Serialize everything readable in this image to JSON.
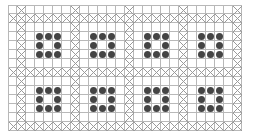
{
  "board": {
    "cols": 26,
    "rows": 14,
    "cell_size": 9,
    "separator_cols": [
      1,
      7,
      13,
      19,
      25
    ],
    "separator_rows": [
      1,
      7,
      13
    ],
    "blocks": [
      {
        "row": 0,
        "col": 0,
        "pieces": 8
      },
      {
        "row": 0,
        "col": 1,
        "pieces": 8
      },
      {
        "row": 0,
        "col": 2,
        "pieces": 8
      },
      {
        "row": 0,
        "col": 3,
        "pieces": 8
      },
      {
        "row": 1,
        "col": 0,
        "pieces": 8
      },
      {
        "row": 1,
        "col": 1,
        "pieces": 8
      },
      {
        "row": 1,
        "col": 2,
        "pieces": 8
      },
      {
        "row": 1,
        "col": 3,
        "pieces": 8
      }
    ],
    "piece_pattern": "3x3 ring, center empty",
    "colors": {
      "grid_line": "#b8b8b8",
      "x_mark": "#9a9a9a",
      "piece": "#444444",
      "background": "#ffffff"
    }
  }
}
